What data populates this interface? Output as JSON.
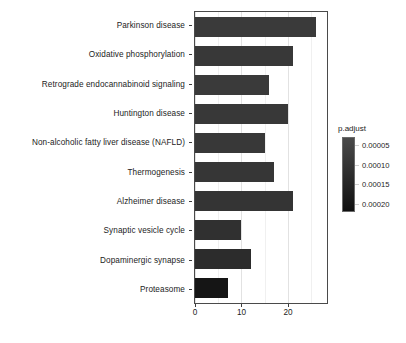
{
  "chart_data": {
    "type": "bar",
    "orientation": "horizontal",
    "title": "",
    "xlabel": "",
    "ylabel": "",
    "xlim": [
      0,
      28.4
    ],
    "xticks": [
      0,
      10,
      20
    ],
    "xtick_labels": [
      "0",
      "10",
      "20"
    ],
    "grid": true,
    "grid_axis": "x",
    "categories": [
      "Parkinson disease",
      "Oxidative phosphorylation",
      "Retrograde endocannabinoid signaling",
      "Huntington disease",
      "Non-alcoholic fatty liver disease (NAFLD)",
      "Thermogenesis",
      "Alzheimer disease",
      "Synaptic vesicle cycle",
      "Dopaminergic synapse",
      "Proteasome"
    ],
    "values": [
      26,
      21,
      16,
      20,
      15,
      17,
      21,
      10,
      12,
      7
    ],
    "bar_colors": [
      "#3a3a3a",
      "#383838",
      "#3a3a3a",
      "#383838",
      "#383838",
      "#363636",
      "#343434",
      "#303030",
      "#2c2c2c",
      "#151515"
    ],
    "color_values": [
      7e-05,
      8e-05,
      7e-05,
      8e-05,
      8e-05,
      9e-05,
      0.0001,
      0.00012,
      0.00014,
      0.00021
    ],
    "legend": {
      "position": "right",
      "type": "colorbar",
      "title": "p.adjust",
      "ticks": [
        5e-05,
        0.0001,
        0.00015,
        0.0002
      ],
      "tick_labels": [
        "0.00005",
        "0.00010",
        "0.00015",
        "0.00020"
      ],
      "range": [
        3e-05,
        0.00022
      ],
      "gradient_top_color": "#4a4a4a",
      "gradient_bottom_color": "#101010"
    }
  }
}
